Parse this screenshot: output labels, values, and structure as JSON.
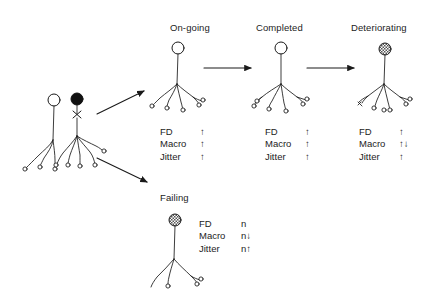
{
  "figure": {
    "type": "diagram",
    "background_color": "#ffffff",
    "ink_color": "#1a1a1a"
  },
  "source_unit": {
    "name": "source-motor-units",
    "cell_bodies": [
      {
        "id": "healthy",
        "fill": "open",
        "marker": ""
      },
      {
        "id": "denervated",
        "fill": "filled",
        "marker": "x"
      }
    ]
  },
  "flow_arrows": [
    {
      "id": "branch-up",
      "from": "source-motor-units",
      "to": "On-going",
      "direction": "up-right"
    },
    {
      "id": "branch-down",
      "from": "source-motor-units",
      "to": "Failing",
      "direction": "down-right"
    },
    {
      "id": "stage-1-2",
      "from": "On-going",
      "to": "Completed",
      "direction": "right"
    },
    {
      "id": "stage-2-3",
      "from": "Completed",
      "to": "Deteriorating",
      "direction": "right"
    }
  ],
  "panels": [
    {
      "id": "ongoing",
      "title": "On-going",
      "soma_style": "open",
      "metrics": [
        {
          "label": "FD",
          "value": "↑"
        },
        {
          "label": "Macro",
          "value": "↑"
        },
        {
          "label": "Jitter",
          "value": "↑"
        }
      ]
    },
    {
      "id": "completed",
      "title": "Completed",
      "soma_style": "open",
      "metrics": [
        {
          "label": "FD",
          "value": "↑"
        },
        {
          "label": "Macro",
          "value": "↑"
        },
        {
          "label": "Jitter",
          "value": "↑"
        }
      ]
    },
    {
      "id": "deteriorating",
      "title": "Deteriorating",
      "soma_style": "hatched",
      "metrics": [
        {
          "label": "FD",
          "value": "↑"
        },
        {
          "label": "Macro",
          "value": "↑↓"
        },
        {
          "label": "Jitter",
          "value": "↑"
        }
      ]
    },
    {
      "id": "failing",
      "title": "Failing",
      "soma_style": "hatched",
      "metrics": [
        {
          "label": "FD",
          "value": "n"
        },
        {
          "label": "Macro",
          "value": "n↓"
        },
        {
          "label": "Jitter",
          "value": "n↑"
        }
      ]
    }
  ]
}
